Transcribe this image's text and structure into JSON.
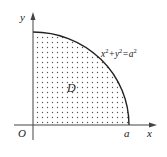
{
  "diagram": {
    "axes": {
      "x_label": "x",
      "y_label": "y",
      "origin_label": "O"
    },
    "region": {
      "label": "D",
      "fill_pattern": "dots",
      "shape": "quarter-disk (first quadrant)"
    },
    "curve": {
      "equation": "x²+y²=a²",
      "eq_x": "x",
      "eq_sup1": "2",
      "eq_plus": "+y",
      "eq_sup2": "2",
      "eq_equals": "=a",
      "eq_sup3": "2"
    },
    "intercept_label": "a",
    "colors": {
      "stroke": "#222222",
      "dots": "#555555",
      "background": "#ffffff"
    }
  }
}
